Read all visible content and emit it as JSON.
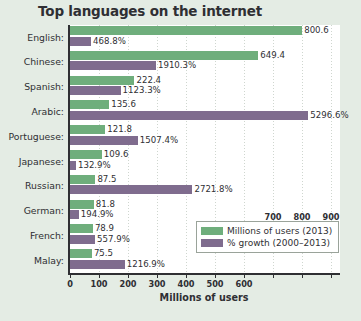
{
  "chart_data": {
    "type": "bar",
    "title": "Top languages on the internet",
    "xlabel": "Millions of users",
    "ylabel": "",
    "orientation": "horizontal",
    "grid": true,
    "legend_position": "bottom-right",
    "xlim": [
      0,
      900
    ],
    "xticks": [
      0,
      100,
      200,
      300,
      400,
      500,
      600,
      700,
      800,
      900
    ],
    "xtick_labels": [
      "0",
      "100",
      "200",
      "300",
      "400",
      "500",
      "600",
      "700",
      "800",
      "900"
    ],
    "categories": [
      "English:",
      "Chinese:",
      "Spanish:",
      "Arabic:",
      "Portuguese:",
      "Japanese:",
      "Russian:",
      "German:",
      "French:",
      "Malay:"
    ],
    "series": [
      {
        "name": "Millions of users (2013)",
        "color": "#6fae7c",
        "values": [
          800.6,
          649.4,
          222.4,
          135.6,
          121.8,
          109.6,
          87.5,
          81.8,
          78.9,
          75.5
        ],
        "labels": [
          "800.6",
          "649.4",
          "222.4",
          "135.6",
          "121.8",
          "109.6",
          "87.5",
          "81.8",
          "78.9",
          "75.5"
        ]
      },
      {
        "name": "% growth (2000–2013)",
        "color": "#7f6c8e",
        "values": [
          468.8,
          1910.3,
          1123.3,
          5296.6,
          1507.4,
          132.9,
          2721.8,
          194.9,
          557.9,
          1216.9
        ],
        "labels": [
          "468.8%",
          "1910.3%",
          "1123.3%",
          "5296.6%",
          "1507.4%",
          "132.9%",
          "2721.8%",
          "194.9%",
          "557.9%",
          "1216.9%"
        ]
      }
    ]
  },
  "legend": {
    "items": [
      {
        "label": "Millions of users (2013)"
      },
      {
        "label": "% growth (2000–2013)"
      }
    ]
  },
  "colors": {
    "background": "#e4ece4",
    "plot_background": "#ffffff",
    "users_bar": "#6fae7c",
    "growth_bar": "#7f6c8e",
    "text": "#2f2f33"
  }
}
